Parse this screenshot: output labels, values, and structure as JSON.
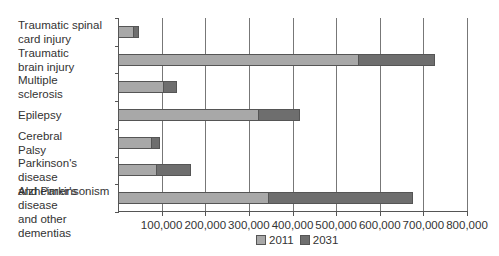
{
  "chart_data": {
    "type": "bar",
    "orientation": "horizontal",
    "stacked": true,
    "title": "",
    "xlabel": "",
    "ylabel": "",
    "xlim": [
      0,
      800000
    ],
    "grid": true,
    "legend_position": "bottom",
    "categories": [
      "Traumatic spinal card injury",
      "Traumatic brain injury",
      "Multiple sclerosis",
      "Epilepsy",
      "Cerebral Palsy",
      "Parkinson's disease and Parkinsonism",
      "Alzheimer's disease and other dementias"
    ],
    "series": [
      {
        "name": "2011",
        "color": "#a8a8a8",
        "values": [
          34000,
          550000,
          103000,
          322000,
          76000,
          87000,
          343000
        ]
      },
      {
        "name": "2031",
        "color": "#6e6e6e",
        "values": [
          14000,
          177000,
          32000,
          96000,
          20000,
          81000,
          333000
        ]
      }
    ],
    "totals": [
      48000,
      727000,
      135000,
      418000,
      96000,
      168000,
      676000
    ],
    "x_tick_labels": [
      "100,000",
      "200,000",
      "300,000",
      "400,000",
      "500,000",
      "600,000",
      "700,000",
      "800,000"
    ],
    "x_tick_values": [
      100000,
      200000,
      300000,
      400000,
      500000,
      600000,
      700000,
      800000
    ]
  },
  "labels": [
    [
      "Traumatic spinal",
      "card injury"
    ],
    [
      "Traumatic",
      "brain injury"
    ],
    [
      "Multiple",
      "sclerosis"
    ],
    [
      "Epilepsy"
    ],
    [
      "Cerebral",
      "Palsy"
    ],
    [
      "Parkinson's disease",
      "and Parkinsonism"
    ],
    [
      "Alzheimer's disease",
      "and other dementias"
    ]
  ],
  "legend": [
    {
      "label": "2011",
      "color": "#a8a8a8"
    },
    {
      "label": "2031",
      "color": "#6e6e6e"
    }
  ]
}
